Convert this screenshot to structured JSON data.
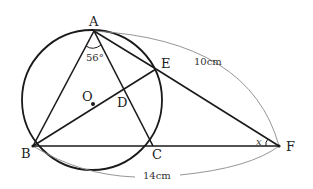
{
  "figure": {
    "type": "geometry",
    "points": {
      "A": {
        "label": "A",
        "x": 94,
        "y": 31
      },
      "B": {
        "label": "B",
        "x": 33,
        "y": 146
      },
      "C": {
        "label": "C",
        "x": 153,
        "y": 146
      },
      "D": {
        "label": "D",
        "x": 122,
        "y": 98
      },
      "E": {
        "label": "E",
        "x": 156,
        "y": 69
      },
      "F": {
        "label": "F",
        "x": 279,
        "y": 146
      },
      "O": {
        "label": "O",
        "x": 93,
        "y": 104
      }
    },
    "circle": {
      "center": "O",
      "cx": 92,
      "cy": 100,
      "r": 70
    },
    "segments": [
      "AB",
      "AC",
      "AE",
      "BE",
      "BF",
      "EF"
    ],
    "annotations": {
      "angle_A": "56°",
      "angle_F": "x",
      "length_AF": "10cm",
      "length_BF": "14cm"
    },
    "colors": {
      "stroke": "#1a1a1a",
      "dimension_arc": "#8a8a8a"
    }
  }
}
